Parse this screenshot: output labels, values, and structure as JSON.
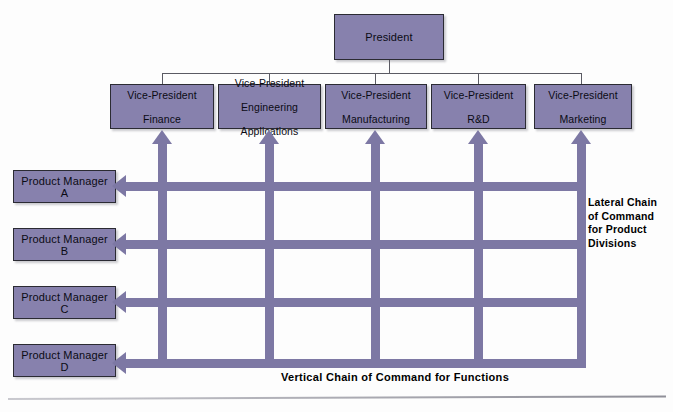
{
  "figure": {
    "type": "matrix-organization-chart",
    "background_color": "#fdfdfd",
    "box_fill_color": "#8781ad",
    "bar_color": "#7d78a4",
    "box_border_color": "#2b2b33"
  },
  "top": {
    "president": {
      "label": "President"
    }
  },
  "vice_presidents": [
    {
      "label": "Vice-President\nFinance",
      "line1": "Vice-President",
      "line2": "Finance"
    },
    {
      "label": "Vice-President\nEngineering\nApplications",
      "line1": "Vice-President",
      "line2": "Engineering",
      "line3": "Applications"
    },
    {
      "label": "Vice-President\nManufacturing",
      "line1": "Vice-President",
      "line2": "Manufacturing"
    },
    {
      "label": "Vice-President\nR&D",
      "line1": "Vice-President",
      "line2": "R&D"
    },
    {
      "label": "Vice-President\nMarketing",
      "line1": "Vice-President",
      "line2": "Marketing"
    }
  ],
  "product_managers": [
    {
      "label": "Product Manager A"
    },
    {
      "label": "Product Manager B"
    },
    {
      "label": "Product Manager C"
    },
    {
      "label": "Product Manager D"
    }
  ],
  "captions": {
    "lateral": {
      "line1": "Lateral Chain",
      "line2": "of Command",
      "line3": "for Product",
      "line4": "Divisions",
      "full": "Lateral Chain of Command for Product Divisions"
    },
    "vertical": {
      "full": "Vertical Chain of Command for Functions"
    }
  }
}
